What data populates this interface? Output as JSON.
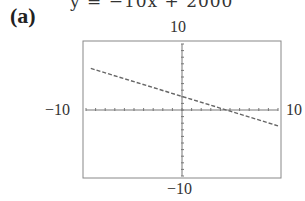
{
  "header": {
    "equation_partial": "y = −10x + 2000"
  },
  "panel_label": "(a)",
  "chart_data": {
    "type": "line",
    "title": "",
    "xlabel": "",
    "ylabel": "",
    "xlim": [
      -10,
      10
    ],
    "ylim": [
      -10,
      10
    ],
    "tick_labels": {
      "top": "10",
      "bottom": "-10",
      "left": "-10",
      "right": "10"
    },
    "grid": false,
    "series": [
      {
        "name": "line",
        "style": "dashed",
        "x": [
          -9.5,
          10
        ],
        "y": [
          6.3,
          -2.4
        ]
      }
    ]
  },
  "labels": {
    "ymax": "10",
    "ymin": "−10",
    "xmin": "−10",
    "xmax": "10"
  }
}
